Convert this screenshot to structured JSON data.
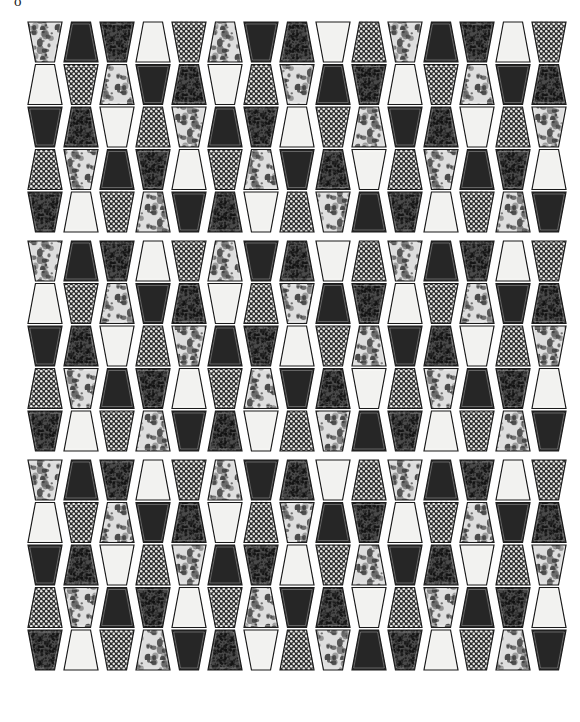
{
  "figure": {
    "corner_mark": "o",
    "caption": "",
    "background_color": "#ffffff",
    "width": 580,
    "height": 722
  },
  "pattern": {
    "type": "trapezoid-tessellation",
    "bands": 3,
    "rows_per_band": 5,
    "columns": 15,
    "tile_width": 34,
    "tile_height": 40,
    "row_pitch": 42.5,
    "band_pitch": 219,
    "origin_x": 28,
    "origin_y": 22,
    "outline_color": "#1a1a1a",
    "outline_width": 1.2,
    "tile_gap": 2.0,
    "taper_ratio": 0.22
  },
  "fills": {
    "legend": [
      {
        "key": "light",
        "label": "light / blank",
        "color": "#f2f2f0"
      },
      {
        "key": "dark",
        "label": "solid dark",
        "color": "#262626"
      },
      {
        "key": "dots",
        "label": "dotted grid",
        "color": "#2e2e2e"
      },
      {
        "key": "speckle",
        "label": "coarse speckle",
        "color": "#3a3a3a"
      },
      {
        "key": "mottle",
        "label": "light mottled",
        "color": "#d0d0cc"
      },
      {
        "key": "grain",
        "label": "fine grain",
        "color": "#454545"
      }
    ]
  },
  "grid": {
    "band1": [
      [
        "mottle",
        "dark",
        "grain",
        "light",
        "dots",
        "mottle",
        "dark",
        "grain",
        "light",
        "dots",
        "mottle",
        "dark",
        "grain",
        "light",
        "dots"
      ],
      [
        "light",
        "dots",
        "mottle",
        "dark",
        "grain",
        "light",
        "dots",
        "mottle",
        "dark",
        "grain",
        "light",
        "dots",
        "mottle",
        "dark",
        "grain"
      ],
      [
        "dark",
        "grain",
        "light",
        "dots",
        "mottle",
        "dark",
        "grain",
        "light",
        "dots",
        "mottle",
        "dark",
        "grain",
        "light",
        "dots",
        "mottle"
      ],
      [
        "dots",
        "mottle",
        "dark",
        "grain",
        "light",
        "dots",
        "mottle",
        "dark",
        "grain",
        "light",
        "dots",
        "mottle",
        "dark",
        "grain",
        "light"
      ],
      [
        "grain",
        "light",
        "dots",
        "mottle",
        "dark",
        "grain",
        "light",
        "dots",
        "mottle",
        "dark",
        "grain",
        "light",
        "dots",
        "mottle",
        "dark"
      ]
    ],
    "band2": [
      [
        "mottle",
        "dark",
        "grain",
        "light",
        "dots",
        "mottle",
        "dark",
        "grain",
        "light",
        "dots",
        "mottle",
        "dark",
        "grain",
        "light",
        "dots"
      ],
      [
        "light",
        "dots",
        "mottle",
        "dark",
        "grain",
        "light",
        "dots",
        "mottle",
        "dark",
        "grain",
        "light",
        "dots",
        "mottle",
        "dark",
        "grain"
      ],
      [
        "dark",
        "grain",
        "light",
        "dots",
        "mottle",
        "dark",
        "grain",
        "light",
        "dots",
        "mottle",
        "dark",
        "grain",
        "light",
        "dots",
        "mottle"
      ],
      [
        "dots",
        "mottle",
        "dark",
        "grain",
        "light",
        "dots",
        "mottle",
        "dark",
        "grain",
        "light",
        "dots",
        "mottle",
        "dark",
        "grain",
        "light"
      ],
      [
        "grain",
        "light",
        "dots",
        "mottle",
        "dark",
        "grain",
        "light",
        "dots",
        "mottle",
        "dark",
        "grain",
        "light",
        "dots",
        "mottle",
        "dark"
      ]
    ],
    "band3": [
      [
        "mottle",
        "dark",
        "grain",
        "light",
        "dots",
        "mottle",
        "dark",
        "grain",
        "light",
        "dots",
        "mottle",
        "dark",
        "grain",
        "light",
        "dots"
      ],
      [
        "light",
        "dots",
        "mottle",
        "dark",
        "grain",
        "light",
        "dots",
        "mottle",
        "dark",
        "grain",
        "light",
        "dots",
        "mottle",
        "dark",
        "grain"
      ],
      [
        "dark",
        "grain",
        "light",
        "dots",
        "mottle",
        "dark",
        "grain",
        "light",
        "dots",
        "mottle",
        "dark",
        "grain",
        "light",
        "dots",
        "mottle"
      ],
      [
        "dots",
        "mottle",
        "dark",
        "grain",
        "light",
        "dots",
        "mottle",
        "dark",
        "grain",
        "light",
        "dots",
        "mottle",
        "dark",
        "grain",
        "light"
      ],
      [
        "grain",
        "light",
        "dots",
        "mottle",
        "dark",
        "grain",
        "light",
        "dots",
        "mottle",
        "dark",
        "grain",
        "light",
        "dots",
        "mottle",
        "dark"
      ]
    ]
  }
}
